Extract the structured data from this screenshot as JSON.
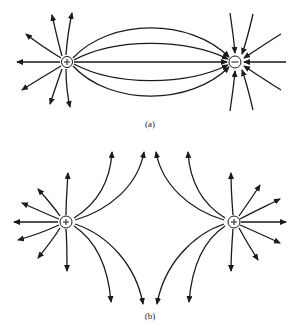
{
  "figure": {
    "panels": [
      {
        "id": "a",
        "label": "(a)",
        "description": "Electric field lines between a positive and a negative charge (dipole)",
        "charges": [
          {
            "sign": "+",
            "symbol": "+",
            "x": 67,
            "y": 62
          },
          {
            "sign": "-",
            "symbol": "−",
            "x": 235,
            "y": 62
          }
        ]
      },
      {
        "id": "b",
        "label": "(b)",
        "description": "Electric field lines of two equal positive charges repelling",
        "charges": [
          {
            "sign": "+",
            "symbol": "+",
            "x": 65,
            "y": 222
          },
          {
            "sign": "+",
            "symbol": "+",
            "x": 234,
            "y": 222
          }
        ]
      }
    ],
    "colors": {
      "ink": "#1a1a1a",
      "background": "#ffffff"
    }
  }
}
